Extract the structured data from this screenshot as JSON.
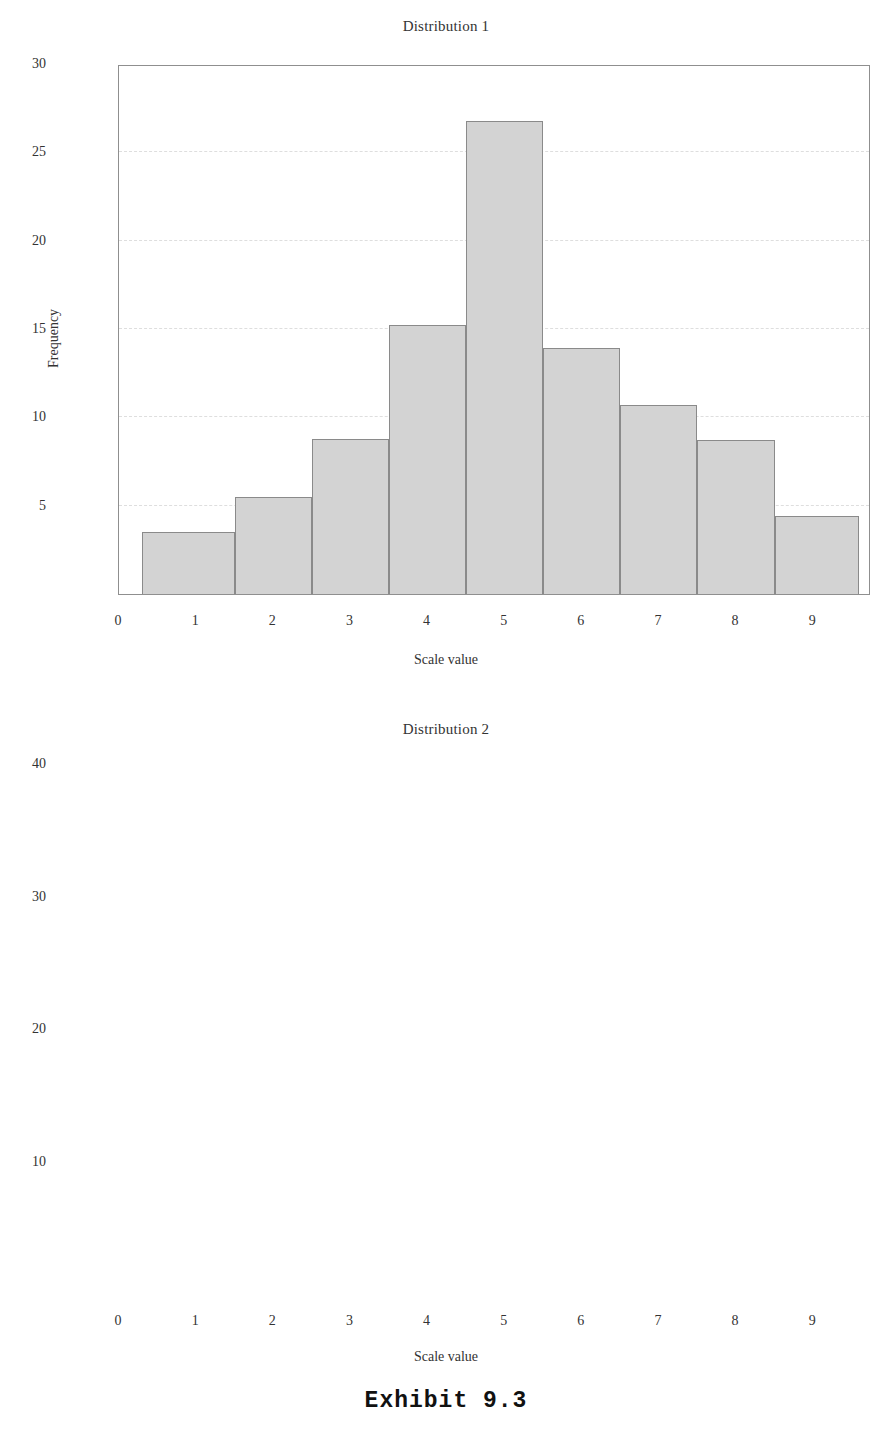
{
  "caption": {
    "text": "Exhibit 9.3"
  },
  "charts": [
    {
      "title": "Distribution 1",
      "xlabel": "Scale value",
      "ylabel": "Frequency",
      "yticks": [
        "5",
        "10",
        "15",
        "20",
        "25",
        "30"
      ],
      "xticks": [
        "0",
        "1",
        "2",
        "3",
        "4",
        "5",
        "6",
        "7",
        "8",
        "9"
      ]
    },
    {
      "title": "Distribution 2",
      "xlabel": "Scale value",
      "ylabel": "Frequency",
      "yticks": [
        "10",
        "20",
        "30",
        "40"
      ],
      "xticks": [
        "0",
        "1",
        "2",
        "3",
        "4",
        "5",
        "6",
        "7",
        "8",
        "9"
      ]
    }
  ],
  "chart_data": [
    {
      "type": "bar",
      "title": "Distribution 1",
      "xlabel": "Scale value",
      "ylabel": "Frequency",
      "grid": true,
      "legend": "none",
      "bin_edges": [
        0.3,
        1.5,
        2.5,
        3.5,
        4.5,
        5.5,
        6.5,
        7.5,
        8.5,
        9.6
      ],
      "categories": [
        "0.3-1.5",
        "1.5-2.5",
        "2.5-3.5",
        "3.5-4.5",
        "4.5-5.5",
        "5.5-6.5",
        "6.5-7.5",
        "7.5-8.5",
        "8.5-9.6"
      ],
      "values": [
        3.5,
        5.5,
        8.8,
        15.2,
        26.8,
        13.9,
        10.7,
        8.7,
        4.4
      ],
      "xlim": [
        0.0,
        9.75
      ],
      "ylim": [
        0,
        30
      ],
      "ytick_values": [
        5,
        10,
        15,
        20,
        25,
        30
      ],
      "xtick_values": [
        0,
        1,
        2,
        3,
        4,
        5,
        6,
        7,
        8,
        9
      ]
    },
    {
      "type": "bar",
      "title": "Distribution 2",
      "xlabel": "Scale value",
      "ylabel": "Frequency",
      "grid": true,
      "legend": "none",
      "bin_edges": [
        2.5,
        3.5,
        4.5,
        5.5,
        6.5,
        7.5
      ],
      "categories": [
        "2.5-3.5",
        "3.5-4.5",
        "4.5-5.5",
        "5.5-6.5",
        "6.5-7.5"
      ],
      "values": [
        8.0,
        20.5,
        37.5,
        20.5,
        11.5
      ],
      "xlim": [
        0.0,
        9.75
      ],
      "ylim": [
        0,
        40
      ],
      "ytick_values": [
        10,
        20,
        30,
        40
      ],
      "xtick_values": [
        0,
        1,
        2,
        3,
        4,
        5,
        6,
        7,
        8,
        9
      ]
    }
  ],
  "style": {
    "bar_fill": "#d3d3d3",
    "bar_stroke": "#8a8a8a",
    "axis_color": "#8f8f8f",
    "grid_color": "#dedede",
    "text_color": "#333333",
    "background": "#ffffff"
  }
}
